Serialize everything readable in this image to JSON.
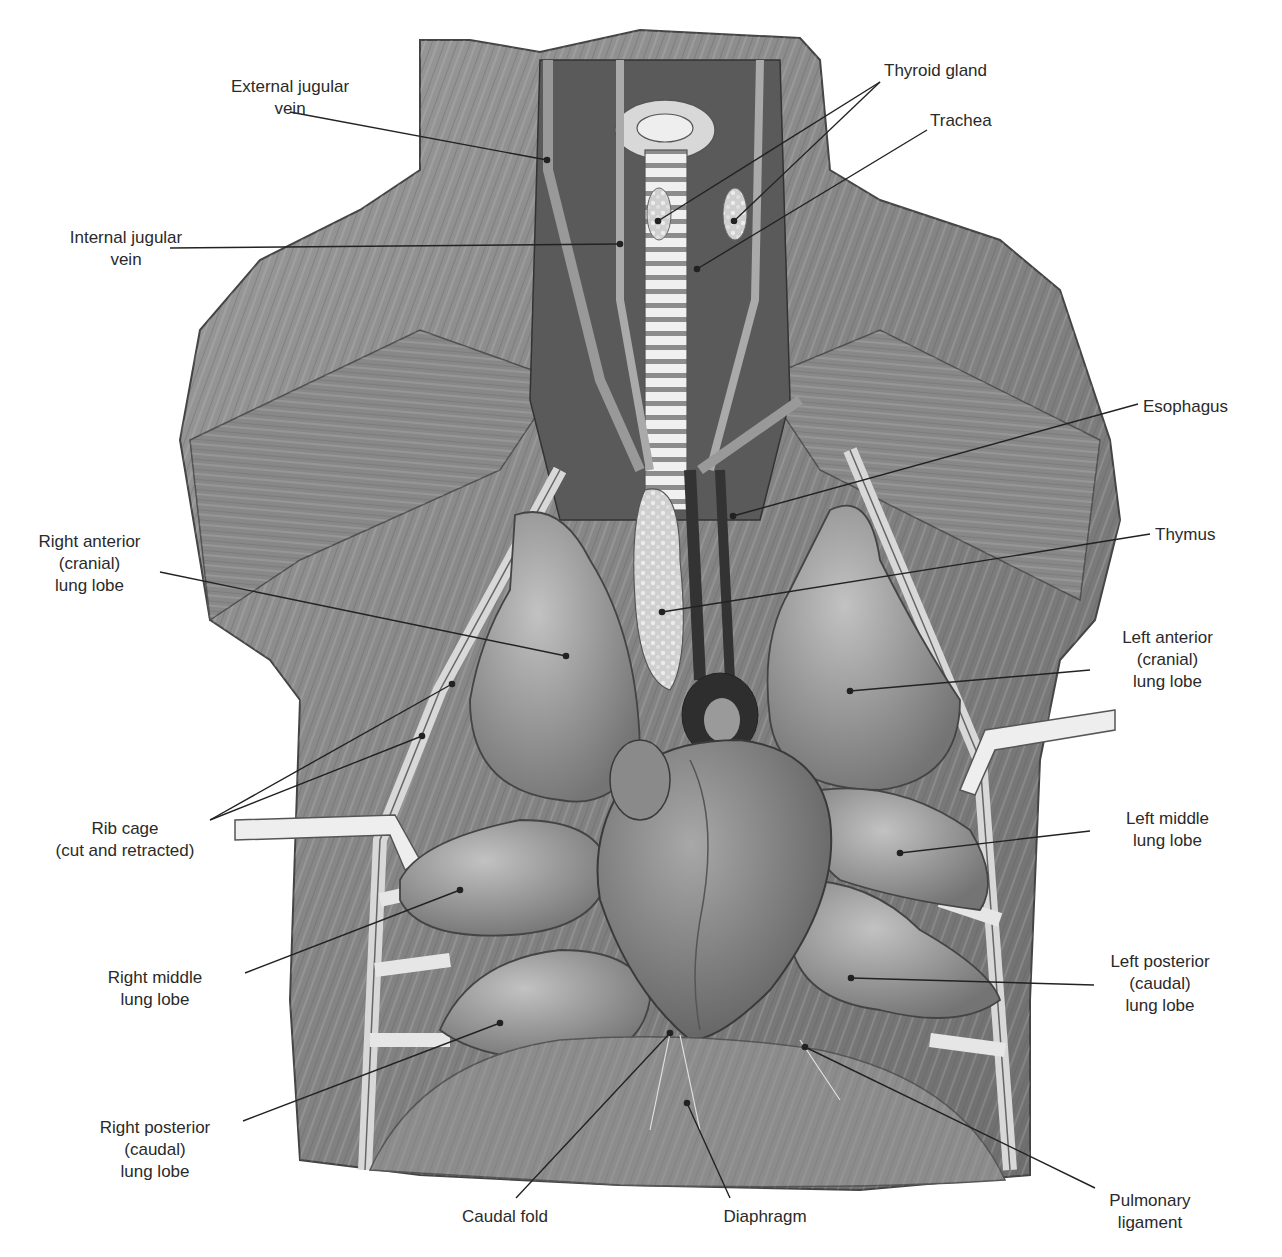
{
  "figure": {
    "colors": {
      "background": "#ffffff",
      "muscle": "#8a8a8a",
      "muscle_dark": "#5e5e5e",
      "organ": "#9a9a9a",
      "organ_light": "#b8b8b8",
      "cavity_dark": "#4a4a4a",
      "leader_line": "#222222",
      "text": "#2a2a2a"
    }
  },
  "labels": [
    {
      "id": "external-jugular-vein",
      "lines": [
        "External jugular",
        "vein"
      ],
      "x": 190,
      "y": 76,
      "align": "center",
      "w": 200,
      "leader": [
        [
          290,
          112
        ],
        [
          547,
          160
        ]
      ]
    },
    {
      "id": "internal-jugular-vein",
      "lines": [
        "Internal jugular",
        "vein"
      ],
      "x": 26,
      "y": 227,
      "align": "center",
      "w": 200,
      "leader": [
        [
          170,
          248
        ],
        [
          620,
          244
        ]
      ]
    },
    {
      "id": "thyroid-gland",
      "lines": [
        "Thyroid gland"
      ],
      "x": 884,
      "y": 60,
      "align": "left",
      "w": 150,
      "leader": [
        [
          880,
          82
        ],
        [
          658,
          221
        ]
      ],
      "leader2": [
        [
          880,
          82
        ],
        [
          734,
          221
        ]
      ]
    },
    {
      "id": "trachea",
      "lines": [
        "Trachea"
      ],
      "x": 930,
      "y": 110,
      "align": "left",
      "w": 100,
      "leader": [
        [
          927,
          130
        ],
        [
          697,
          269
        ]
      ]
    },
    {
      "id": "esophagus",
      "lines": [
        "Esophagus"
      ],
      "x": 1143,
      "y": 396,
      "align": "left",
      "w": 120,
      "leader": [
        [
          1138,
          404
        ],
        [
          733,
          516
        ]
      ]
    },
    {
      "id": "thymus",
      "lines": [
        "Thymus"
      ],
      "x": 1155,
      "y": 524,
      "align": "left",
      "w": 100,
      "leader": [
        [
          1150,
          534
        ],
        [
          662,
          612
        ]
      ]
    },
    {
      "id": "right-anterior-lung-lobe",
      "lines": [
        "Right anterior",
        "(cranial)",
        "lung lobe"
      ],
      "x": 12,
      "y": 531,
      "align": "center",
      "w": 155,
      "leader": [
        [
          160,
          572
        ],
        [
          566,
          656
        ]
      ]
    },
    {
      "id": "left-anterior-lung-lobe",
      "lines": [
        "Left anterior",
        "(cranial)",
        "lung lobe"
      ],
      "x": 1095,
      "y": 627,
      "align": "center",
      "w": 145,
      "leader": [
        [
          1090,
          670
        ],
        [
          850,
          691
        ]
      ]
    },
    {
      "id": "rib-cage",
      "lines": [
        "Rib cage",
        "(cut and retracted)"
      ],
      "x": 25,
      "y": 818,
      "align": "center",
      "w": 200,
      "leader": [
        [
          210,
          820
        ],
        [
          452,
          684
        ]
      ],
      "leader2": [
        [
          210,
          820
        ],
        [
          422,
          736
        ]
      ]
    },
    {
      "id": "left-middle-lung-lobe",
      "lines": [
        "Left middle",
        "lung lobe"
      ],
      "x": 1095,
      "y": 808,
      "align": "center",
      "w": 145,
      "leader": [
        [
          1090,
          831
        ],
        [
          900,
          853
        ]
      ]
    },
    {
      "id": "right-middle-lung-lobe",
      "lines": [
        "Right middle",
        "lung lobe"
      ],
      "x": 80,
      "y": 967,
      "align": "center",
      "w": 150,
      "leader": [
        [
          245,
          973
        ],
        [
          460,
          890
        ]
      ]
    },
    {
      "id": "left-posterior-lung-lobe",
      "lines": [
        "Left posterior",
        "(caudal)",
        "lung lobe"
      ],
      "x": 1085,
      "y": 951,
      "align": "center",
      "w": 150,
      "leader": [
        [
          1094,
          985
        ],
        [
          851,
          978
        ]
      ]
    },
    {
      "id": "right-posterior-lung-lobe",
      "lines": [
        "Right posterior",
        "(caudal)",
        "lung lobe"
      ],
      "x": 60,
      "y": 1117,
      "align": "center",
      "w": 190,
      "leader": [
        [
          243,
          1121
        ],
        [
          500,
          1023
        ]
      ]
    },
    {
      "id": "caudal-fold",
      "lines": [
        "Caudal fold"
      ],
      "x": 440,
      "y": 1206,
      "align": "center",
      "w": 130,
      "leader": [
        [
          516,
          1198
        ],
        [
          670,
          1033
        ]
      ]
    },
    {
      "id": "diaphragm",
      "lines": [
        "Diaphragm"
      ],
      "x": 700,
      "y": 1206,
      "align": "center",
      "w": 130,
      "leader": [
        [
          730,
          1198
        ],
        [
          687,
          1103
        ]
      ]
    },
    {
      "id": "pulmonary-ligament",
      "lines": [
        "Pulmonary",
        "ligament"
      ],
      "x": 1090,
      "y": 1190,
      "align": "center",
      "w": 120,
      "leader": [
        [
          1095,
          1188
        ],
        [
          805,
          1047
        ]
      ]
    }
  ]
}
